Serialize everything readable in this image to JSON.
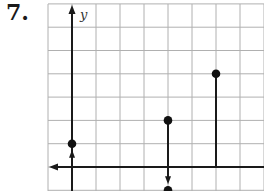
{
  "problem": {
    "number": "7."
  },
  "chart_data": {
    "type": "scatter",
    "title": "",
    "xlabel": "",
    "ylabel": "y",
    "grid": true,
    "x_range": [
      -1,
      8
    ],
    "y_range": [
      -1,
      7
    ],
    "tick_labels": [],
    "points": [
      {
        "x": 0,
        "y": 1,
        "style": "dot",
        "connector": "arrow from x-axis up to point"
      },
      {
        "x": 4,
        "y": 2,
        "style": "dot",
        "connector": "segment down to x-axis"
      },
      {
        "x": 4,
        "y": -1,
        "style": "dot",
        "connector": "arrow from x-axis down to point"
      },
      {
        "x": 6,
        "y": 4,
        "style": "dot",
        "connector": "segment down to x-axis"
      }
    ],
    "annotations": [
      "x-axis has leftward arrow",
      "y-axis has upward arrow"
    ],
    "colors": {
      "grid": "#b0b0b0",
      "axis": "#1a1a1a",
      "points": "#111111"
    }
  }
}
